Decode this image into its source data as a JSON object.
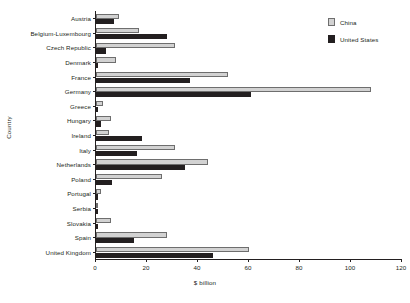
{
  "chart_data": {
    "type": "bar",
    "orientation": "horizontal",
    "title": "",
    "xlabel": "$ billion",
    "ylabel": "Country",
    "xlim": [
      0,
      120
    ],
    "xticks": [
      0,
      20,
      40,
      60,
      80,
      100,
      120
    ],
    "grid": false,
    "legend_position": "top-right",
    "categories": [
      "Austria",
      "Belgium-Luxembourg",
      "Czech Republic",
      "Denmark",
      "France",
      "Germany",
      "Greece",
      "Hungary",
      "Ireland",
      "Italy",
      "Netherlands",
      "Poland",
      "Portugal",
      "Serbia",
      "Slovakia",
      "Spain",
      "United Kingdom"
    ],
    "series": [
      {
        "name": "China",
        "color": "#d2d2d2",
        "values": [
          9,
          17,
          31,
          8,
          52,
          108,
          3,
          6,
          5,
          31,
          44,
          26,
          2,
          1,
          6,
          28,
          60
        ]
      },
      {
        "name": "United States",
        "color": "#231f20",
        "values": [
          7,
          28,
          4,
          1,
          37,
          61,
          1,
          2,
          18,
          16,
          35,
          6.5,
          1,
          0.5,
          1,
          15,
          46
        ]
      }
    ]
  }
}
